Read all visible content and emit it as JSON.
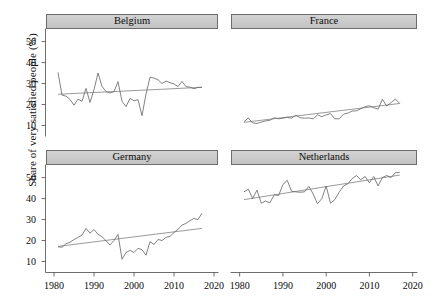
{
  "chart_data": {
    "type": "line",
    "title": "",
    "subtitle": "",
    "xlabel": "",
    "ylabel": "Share of very satisfied people (%)",
    "xlim": [
      1978,
      2021
    ],
    "ylim": [
      5,
      56
    ],
    "xticks": [
      1980,
      1990,
      2000,
      2010,
      2020
    ],
    "xtick_labels": [
      "1980",
      "1990",
      "2000",
      "2010",
      "2020"
    ],
    "yticks": [
      10,
      20,
      30,
      40,
      50
    ],
    "ytick_labels": [
      "10",
      "20",
      "30",
      "40",
      "50"
    ],
    "grid": false,
    "legend": "none",
    "layout": "2x2 facet grid (lattice strip panels)",
    "series_color": "#6b6b6b",
    "trend_color": "#8f8f8f",
    "strip_fill": "#cccccc",
    "panels": [
      {
        "name": "Belgium",
        "position": "top-left",
        "x": [
          1981,
          1982,
          1983,
          1984,
          1985,
          1986,
          1987,
          1988,
          1989,
          1990,
          1991,
          1992,
          1993,
          1994,
          1995,
          1996,
          1997,
          1998,
          1999,
          2000,
          2001,
          2002,
          2003,
          2004,
          2005,
          2006,
          2007,
          2008,
          2009,
          2010,
          2011,
          2012,
          2013,
          2014,
          2015,
          2016,
          2017
        ],
        "values": [
          35.3,
          24.5,
          24.0,
          22.4,
          19.7,
          22.6,
          21.5,
          27.7,
          21.0,
          27.1,
          35.0,
          28.6,
          26.2,
          25.5,
          26.2,
          30.9,
          21.5,
          19.0,
          22.9,
          21.8,
          22.3,
          14.7,
          25.0,
          33.0,
          32.6,
          31.8,
          30.0,
          31.2,
          30.4,
          29.8,
          28.6,
          31.0,
          28.5,
          28.3,
          27.5,
          28.2,
          28.2
        ],
        "trend": {
          "x": [
            1981,
            2017
          ],
          "y": [
            24.9,
            28.2
          ],
          "slope_per_year": 0.09
        }
      },
      {
        "name": "France",
        "position": "top-right",
        "x": [
          1981,
          1982,
          1983,
          1984,
          1985,
          1986,
          1987,
          1988,
          1989,
          1990,
          1991,
          1992,
          1993,
          1994,
          1995,
          1996,
          1997,
          1998,
          1999,
          2000,
          2001,
          2002,
          2003,
          2004,
          2005,
          2006,
          2007,
          2008,
          2009,
          2010,
          2011,
          2012,
          2013,
          2014,
          2015,
          2016,
          2017
        ],
        "values": [
          11.8,
          13.6,
          11.2,
          11.0,
          11.6,
          12.2,
          12.5,
          13.7,
          13.2,
          13.5,
          13.9,
          13.5,
          14.9,
          13.7,
          13.5,
          13.6,
          13.2,
          15.1,
          14.2,
          15.1,
          15.7,
          13.2,
          13.2,
          15.4,
          15.9,
          16.9,
          17.0,
          18.0,
          19.0,
          19.4,
          18.5,
          17.8,
          22.5,
          19.3,
          20.9,
          22.6,
          20.5
        ],
        "trend": {
          "x": [
            1981,
            2017
          ],
          "y": [
            11.5,
            20.5
          ],
          "slope_per_year": 0.25
        }
      },
      {
        "name": "Germany",
        "position": "bottom-left",
        "x": [
          1981,
          1982,
          1983,
          1984,
          1985,
          1986,
          1987,
          1988,
          1989,
          1990,
          1991,
          1992,
          1993,
          1994,
          1995,
          1996,
          1997,
          1998,
          1999,
          2000,
          2001,
          2002,
          2003,
          2004,
          2005,
          2006,
          2007,
          2008,
          2009,
          2010,
          2011,
          2012,
          2013,
          2014,
          2015,
          2016,
          2017
        ],
        "values": [
          17.0,
          16.8,
          18.5,
          19.2,
          20.5,
          21.5,
          22.6,
          25.8,
          23.5,
          25.2,
          23.0,
          21.8,
          19.9,
          17.9,
          20.0,
          22.9,
          11.1,
          14.3,
          15.3,
          14.3,
          16.3,
          15.6,
          13.0,
          19.5,
          18.1,
          20.5,
          20.0,
          21.5,
          22.0,
          23.8,
          25.4,
          27.3,
          28.2,
          29.5,
          30.5,
          30.0,
          33.0
        ],
        "trend": {
          "x": [
            1981,
            2017
          ],
          "y": [
            17.2,
            25.8
          ],
          "slope_per_year": 0.24
        }
      },
      {
        "name": "Netherlands",
        "position": "bottom-right",
        "x": [
          1981,
          1982,
          1983,
          1984,
          1985,
          1986,
          1987,
          1988,
          1989,
          1990,
          1991,
          1992,
          1993,
          1994,
          1995,
          1996,
          1997,
          1998,
          1999,
          2000,
          2001,
          2002,
          2003,
          2004,
          2005,
          2006,
          2007,
          2008,
          2009,
          2010,
          2011,
          2012,
          2013,
          2014,
          2015,
          2016,
          2017
        ],
        "values": [
          43.2,
          44.5,
          40.0,
          44.0,
          37.8,
          38.8,
          38.0,
          41.8,
          41.4,
          46.7,
          48.7,
          43.5,
          43.2,
          43.0,
          43.2,
          45.8,
          42.2,
          37.5,
          40.0,
          46.0,
          37.8,
          39.5,
          43.0,
          46.0,
          47.0,
          49.5,
          51.0,
          49.0,
          50.5,
          47.5,
          50.5,
          46.0,
          50.0,
          51.0,
          50.0,
          52.3,
          52.5
        ],
        "trend": {
          "x": [
            1981,
            2017
          ],
          "y": [
            39.5,
            51.2
          ],
          "slope_per_year": 0.32
        }
      }
    ]
  },
  "figure": {
    "y_axis_label": "Share of very satisfied people (%)"
  }
}
